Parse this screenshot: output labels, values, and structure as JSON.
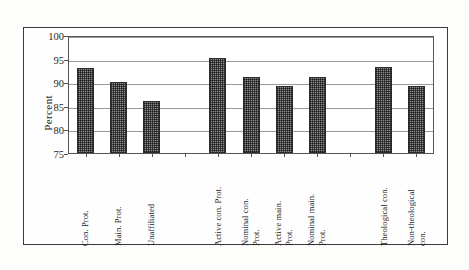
{
  "chart_data": {
    "type": "bar",
    "title": "",
    "xlabel": "",
    "ylabel": "Percent",
    "ylim": [
      75,
      100
    ],
    "yticks": [
      75,
      80,
      85,
      90,
      95,
      100
    ],
    "grid": true,
    "legend": false,
    "orientation": "vertical",
    "bar_fill": "dithered-gray-checker",
    "categories": [
      "Con. Prot.",
      "Main. Prot.",
      "Unaffiliated",
      "",
      "Active con. Prot.",
      "Nominal con. Prot.",
      "Active main. Prot.",
      "Nominal main. Prot.",
      "",
      "Theological con.",
      "Non-theological con."
    ],
    "values": [
      93,
      90,
      86,
      null,
      95.2,
      91.1,
      89.1,
      91.2,
      null,
      93.3,
      89.2
    ],
    "category_lines": [
      [
        "Con. Prot."
      ],
      [
        "Main. Prot."
      ],
      [
        "Unaffiliated"
      ],
      [
        ""
      ],
      [
        "Active con. Prot."
      ],
      [
        "Nominal con.",
        "Prot."
      ],
      [
        "Active main.",
        "Prot."
      ],
      [
        "Nominal main.",
        "Prot."
      ],
      [
        ""
      ],
      [
        "Theological con."
      ],
      [
        "Non-theological",
        "con."
      ]
    ]
  },
  "colors": {
    "bar_fill": "#8e8e8e",
    "bar_outline": "#2c2c2c",
    "gridline": "#9a9a9a",
    "axis": "#555555",
    "frame": "#3a3a3a",
    "text": "#1f1f1f",
    "background": "#ffffff"
  },
  "axis": {
    "y_title": "Percent",
    "y_tick_labels": [
      "100",
      "95",
      "90",
      "85",
      "80",
      "75"
    ]
  }
}
